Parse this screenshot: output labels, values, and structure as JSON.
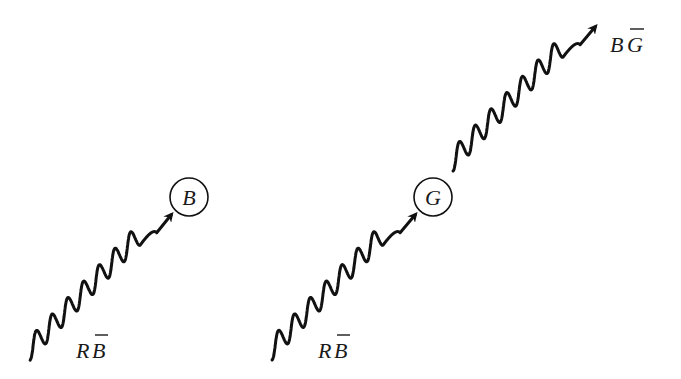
{
  "diagram": {
    "panels": [
      {
        "name": "left",
        "vertex": {
          "label": "B"
        },
        "gluons": [
          {
            "label_main": "R",
            "label_bar": "B",
            "direction": "incoming-to-vertex"
          }
        ]
      },
      {
        "name": "right",
        "vertex": {
          "label": "G"
        },
        "gluons": [
          {
            "label_main": "R",
            "label_bar": "B",
            "direction": "incoming-to-vertex"
          },
          {
            "label_main": "B",
            "label_bar": "G",
            "direction": "outgoing-from-vertex"
          }
        ]
      }
    ],
    "colors": {
      "ink": "#111111",
      "background": "#ffffff"
    }
  }
}
